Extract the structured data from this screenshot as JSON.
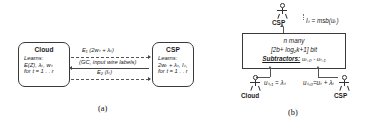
{
  "figure": {
    "panel_a": {
      "caption": "(a)",
      "left_entity": {
        "title": "Cloud",
        "lines": [
          "Learns:",
          "E(Z), λₜ, wₜ",
          "for t = 1 . . r"
        ]
      },
      "right_entity": {
        "title": "CSP",
        "lines": [
          "Learns:",
          "2wₜ + λₜ, Iₜ,",
          "for t = 1 . . r"
        ]
      },
      "messages": [
        {
          "name": "msg-top",
          "label": "E₁ (2wₜ + λₜ)",
          "direction": "right",
          "style": "dashed"
        },
        {
          "name": "msg-middle",
          "label": "(GC, input wire labels)",
          "direction": "left",
          "style": "solid"
        },
        {
          "name": "msg-bottom",
          "label": "E₂ (Iₜ)",
          "direction": "right",
          "style": "dashed"
        }
      ]
    },
    "panel_b": {
      "caption": "(b)",
      "top_actor": {
        "label": "CSP",
        "icon": "stick-figure-icon"
      },
      "top_output_label": "Iₜ = msb(uₜ)",
      "circuit_box": {
        "line1": "n many",
        "line2": "[2b+ log₂k+1] bit",
        "line3_label": "Subtractors:",
        "line3_value": "uₜ,₀ - uₜ,₁"
      },
      "bottom_left_actor": {
        "label": "Cloud",
        "icon": "stick-figure-icon"
      },
      "bottom_right_actor": {
        "label": "CSP",
        "icon": "stick-figure-icon"
      },
      "input_left_label": "uₜ,₁ = λₜ",
      "input_right_label": "uₜ,₀=uₜ + λₜ"
    }
  },
  "colors": {
    "line": "#3a3a3a",
    "dash": "#555555",
    "text": "#1a1a1a",
    "background": "#ffffff"
  }
}
